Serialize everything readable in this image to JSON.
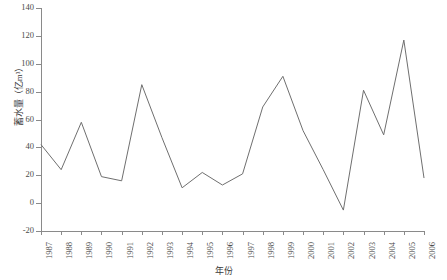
{
  "chart_data": {
    "type": "line",
    "title": "",
    "xlabel": "年份",
    "ylabel": "蓄水量（亿m³）",
    "categories": [
      "1987",
      "1988",
      "1989",
      "1990",
      "1991",
      "1992",
      "1993",
      "1994",
      "1995",
      "1996",
      "1997",
      "1998",
      "1999",
      "2000",
      "2001",
      "2002",
      "2003",
      "2004",
      "2005",
      "2006"
    ],
    "values": [
      42,
      24,
      58,
      19,
      16,
      85,
      47,
      11,
      22,
      13,
      21,
      69,
      91,
      52,
      24,
      -5,
      81,
      49,
      117,
      18
    ],
    "series": [
      {
        "name": "蓄水量",
        "values": [
          42,
          24,
          58,
          19,
          16,
          85,
          47,
          11,
          22,
          13,
          21,
          69,
          91,
          52,
          24,
          -5,
          81,
          49,
          117,
          18
        ]
      }
    ],
    "ylim": [
      -20,
      140
    ],
    "yticks": [
      -20,
      0,
      20,
      40,
      60,
      80,
      100,
      120,
      140
    ],
    "ytick_labels": [
      "-20",
      "0",
      "20",
      "40",
      "60",
      "80",
      "100",
      "120",
      "140"
    ],
    "grid": false,
    "legend": false,
    "line_color": "#6f6f6f",
    "axis_color": "#8a8a8a",
    "text_color": "#4a4a4a",
    "background": "#ffffff"
  }
}
